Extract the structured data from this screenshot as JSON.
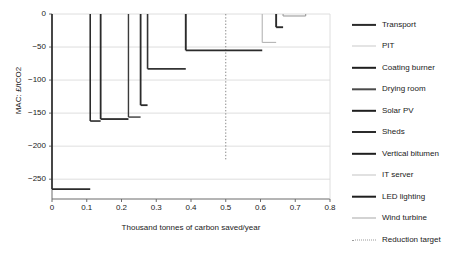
{
  "chart_data": {
    "type": "line",
    "title": "",
    "subtitle": "",
    "xlabel": "Thousand tonnes of carbon saved/year",
    "ylabel": "MAC: £/tCO2",
    "xlim": [
      0,
      0.8
    ],
    "ylim": [
      -280,
      0
    ],
    "xticks": [
      "0",
      "0.1",
      "0.2",
      "0.3",
      "0.4",
      "0.5",
      "0.6",
      "0.7",
      "0.8"
    ],
    "xtick_values": [
      0,
      0.1,
      0.2,
      0.3,
      0.4,
      0.5,
      0.6,
      0.7,
      0.8
    ],
    "yticks": [
      "0",
      "−50",
      "−100",
      "−150",
      "−200",
      "−250"
    ],
    "ytick_values": [
      0,
      -50,
      -100,
      -150,
      -200,
      -250
    ],
    "grid": "horizontal",
    "legend_position": "right",
    "note": "Marginal abatement cost curve (MACC); each measure is a step whose width is annual carbon saved and whose height is the marginal abatement cost.",
    "steps": [
      {
        "name": "Transport",
        "x_start": 0.0,
        "x_end": 0.11,
        "mac": -265,
        "color": "#2b2b2b",
        "width": 1.6
      },
      {
        "name": "PIT",
        "x_start": 0.11,
        "x_end": 0.14,
        "mac": -162,
        "color": "#2b2b2b",
        "width": 1.6
      },
      {
        "name": "Coating burner",
        "x_start": 0.14,
        "x_end": 0.22,
        "mac": -159,
        "color": "#2b2b2b",
        "width": 1.8
      },
      {
        "name": "Drying room",
        "x_start": 0.22,
        "x_end": 0.255,
        "mac": -156,
        "color": "#3a3a3a",
        "width": 1.4
      },
      {
        "name": "Solar PV",
        "x_start": 0.255,
        "x_end": 0.275,
        "mac": -138,
        "color": "#2b2b2b",
        "width": 1.8
      },
      {
        "name": "Sheds",
        "x_start": 0.275,
        "x_end": 0.385,
        "mac": -83,
        "color": "#333333",
        "width": 1.6
      },
      {
        "name": "Vertical bitumen",
        "x_start": 0.385,
        "x_end": 0.605,
        "mac": -55,
        "color": "#2b2b2b",
        "width": 1.9
      },
      {
        "name": "IT server",
        "x_start": 0.605,
        "x_end": 0.645,
        "mac": -43,
        "color": "#b4b4b4",
        "width": 1.1
      },
      {
        "name": "LED lighting",
        "x_start": 0.645,
        "x_end": 0.665,
        "mac": -20,
        "color": "#2b2b2b",
        "width": 1.9
      },
      {
        "name": "Wind turbine",
        "x_start": 0.665,
        "x_end": 0.73,
        "mac": -3,
        "color": "#9a9a9a",
        "width": 1.1
      }
    ],
    "reduction_target": {
      "label": "Reduction target",
      "x": 0.5,
      "style": "dotted",
      "color": "#8a8a8a"
    },
    "legend": [
      {
        "label": "Transport",
        "color": "#2b2b2b",
        "width": 2.2,
        "style": "solid"
      },
      {
        "label": "PIT",
        "color": "#c9c9c9",
        "width": 1.0,
        "style": "solid"
      },
      {
        "label": "Coating burner",
        "color": "#1f1f1f",
        "width": 2.4,
        "style": "solid"
      },
      {
        "label": "Drying room",
        "color": "#4a4a4a",
        "width": 1.4,
        "style": "solid"
      },
      {
        "label": "Solar PV",
        "color": "#1f1f1f",
        "width": 2.4,
        "style": "solid"
      },
      {
        "label": "Sheds",
        "color": "#2b2b2b",
        "width": 2.0,
        "style": "solid"
      },
      {
        "label": "Vertical bitumen",
        "color": "#1f1f1f",
        "width": 2.4,
        "style": "solid"
      },
      {
        "label": "IT server",
        "color": "#c4c4c4",
        "width": 1.0,
        "style": "solid"
      },
      {
        "label": "LED lighting",
        "color": "#1f1f1f",
        "width": 2.6,
        "style": "solid"
      },
      {
        "label": "Wind turbine",
        "color": "#a8a8a8",
        "width": 1.0,
        "style": "solid"
      },
      {
        "label": "Reduction target",
        "color": "#9a9a9a",
        "width": 1.0,
        "style": "dotted"
      }
    ],
    "colors": {
      "axis": "#6b6b6b",
      "grid": "#d6d6d6",
      "text": "#1a1a1a",
      "background": "#ffffff"
    }
  }
}
